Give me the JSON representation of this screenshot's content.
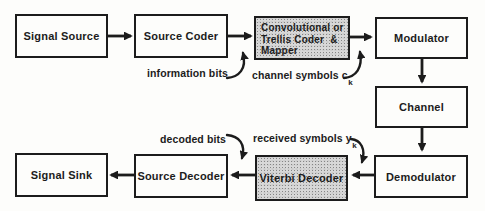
{
  "colors": {
    "ink": "#1c1c1c",
    "shaded_block_fill": "#d8d8d8",
    "background": "#fdfdfb"
  },
  "blocks": {
    "signal_source": {
      "label": "Signal Source"
    },
    "source_coder": {
      "label": "Source Coder"
    },
    "encoder": {
      "line1": "Convolutional or",
      "line2": "Trellis Coder  &",
      "line3": "Mapper"
    },
    "modulator": {
      "label": "Modulator"
    },
    "channel": {
      "label": "Channel"
    },
    "demodulator": {
      "label": "Demodulator"
    },
    "viterbi_decoder": {
      "label": "Viterbi Decoder"
    },
    "source_decoder": {
      "label": "Source Decoder"
    },
    "signal_sink": {
      "label": "Signal Sink"
    }
  },
  "annotations": {
    "information_bits": {
      "text": "information bits"
    },
    "channel_symbols": {
      "text": "channel symbols c",
      "sub": "k"
    },
    "decoded_bits": {
      "text": "decoded bits"
    },
    "received_symbols": {
      "text": "received symbols y",
      "sub": "k"
    }
  }
}
